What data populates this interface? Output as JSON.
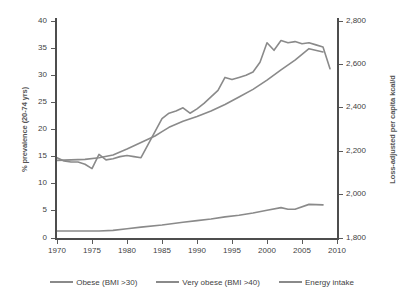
{
  "chart_data": {
    "type": "line",
    "title": "",
    "xlabel": "",
    "ylabel": "% prevalence (20-74 yrs)",
    "ylabel_right": "Loss-adjusted per capita kcal/d",
    "xlim": [
      1970,
      2010
    ],
    "ylim": [
      0,
      40
    ],
    "ylim_right": [
      1800,
      2800
    ],
    "grid": false,
    "legend_position": "bottom",
    "xticks": [
      "1970",
      "1975",
      "1980",
      "1985",
      "1990",
      "1995",
      "2000",
      "2005",
      "2010"
    ],
    "xtick_values": [
      1970,
      1975,
      1980,
      1985,
      1990,
      1995,
      2000,
      2005,
      2010
    ],
    "yticks": [
      "0",
      "5",
      "10",
      "15",
      "20",
      "25",
      "30",
      "35",
      "40"
    ],
    "ytick_values": [
      0,
      5,
      10,
      15,
      20,
      25,
      30,
      35,
      40
    ],
    "yticks_right": [
      "1,800",
      "2,000",
      "2,200",
      "2,400",
      "2,600",
      "2,800"
    ],
    "ytick_values_right": [
      1800,
      2000,
      2200,
      2400,
      2600,
      2800
    ],
    "line_color": "#8a8a8a",
    "axis_color": "#4d4d4d",
    "series": [
      {
        "name": "Obese (BMI >30)",
        "axis": "left",
        "x": [
          1970,
          1974,
          1976,
          1978,
          1980,
          1982,
          1984,
          1985,
          1986,
          1988,
          1990,
          1992,
          1994,
          1996,
          1998,
          2000,
          2002,
          2004,
          2006,
          2008
        ],
        "values": [
          14.3,
          14.5,
          14.8,
          15.3,
          16.4,
          17.6,
          18.8,
          19.6,
          20.4,
          21.5,
          22.4,
          23.4,
          24.6,
          26.0,
          27.4,
          29.1,
          31.0,
          32.8,
          34.9,
          34.3
        ]
      },
      {
        "name": "Very obese (BMI >40)",
        "axis": "left",
        "x": [
          1970,
          1974,
          1976,
          1978,
          1980,
          1982,
          1985,
          1988,
          1990,
          1992,
          1994,
          1996,
          1998,
          2000,
          2002,
          2003,
          2004,
          2006,
          2008
        ],
        "values": [
          1.3,
          1.3,
          1.3,
          1.4,
          1.7,
          2.0,
          2.4,
          2.9,
          3.2,
          3.5,
          3.9,
          4.2,
          4.6,
          5.1,
          5.6,
          5.3,
          5.3,
          6.2,
          6.1
        ]
      },
      {
        "name": "Energy intake",
        "axis": "right",
        "x": [
          1970,
          1971,
          1972,
          1973,
          1974,
          1975,
          1976,
          1977,
          1978,
          1979,
          1980,
          1981,
          1982,
          1983,
          1984,
          1985,
          1986,
          1987,
          1988,
          1989,
          1990,
          1991,
          1992,
          1993,
          1994,
          1995,
          1996,
          1997,
          1998,
          1999,
          2000,
          2001,
          2002,
          2003,
          2004,
          2005,
          2006,
          2007,
          2008,
          2009
        ],
        "values": [
          2170,
          2155,
          2150,
          2150,
          2140,
          2120,
          2185,
          2160,
          2165,
          2175,
          2180,
          2175,
          2170,
          2230,
          2290,
          2350,
          2375,
          2385,
          2400,
          2375,
          2395,
          2420,
          2450,
          2480,
          2540,
          2530,
          2540,
          2550,
          2565,
          2610,
          2700,
          2665,
          2710,
          2700,
          2705,
          2695,
          2700,
          2690,
          2680,
          2580
        ]
      }
    ]
  },
  "legend": {
    "items": [
      {
        "label": "Obese (BMI >30)"
      },
      {
        "label": "Very obese (BMI >40)"
      },
      {
        "label": "Energy intake"
      }
    ]
  }
}
